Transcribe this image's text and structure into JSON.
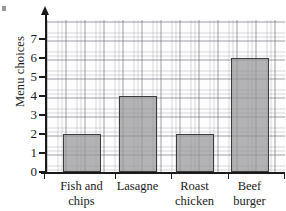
{
  "chart_data": {
    "type": "bar",
    "title": "",
    "xlabel": "",
    "ylabel": "Menu choices",
    "categories": [
      "Fish and\nchips",
      "Lasagne",
      "Roast\nchicken",
      "Beef\nburger"
    ],
    "values": [
      2,
      4,
      2,
      6
    ],
    "ylim": [
      0,
      8
    ],
    "ytick_labels": [
      "0",
      "1",
      "2",
      "3",
      "4",
      "5",
      "6",
      "7"
    ],
    "ytick_values": [
      0,
      1,
      2,
      3,
      4,
      5,
      6,
      7
    ],
    "grid": "graph-paper",
    "legend": "none",
    "bar_fill_color": "#969698",
    "bar_edge_color": "#3a3a3a",
    "axis_color": "#1a1a1a",
    "grid_major_color": "#5a5a64",
    "grid_minor_color": "#82828f",
    "background_color": "#ffffff"
  },
  "axis": {
    "y_label": "Menu choices",
    "y_arrow": "up-arrow-icon"
  }
}
